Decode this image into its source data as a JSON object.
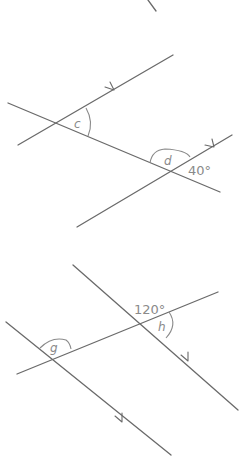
{
  "diagrams": [
    {
      "name": "diagram-1",
      "angles": [
        {
          "label": "c"
        },
        {
          "label": "d"
        },
        {
          "label": "40°"
        }
      ]
    },
    {
      "name": "diagram-2",
      "angles": [
        {
          "label": "120°"
        },
        {
          "label": "h"
        },
        {
          "label": "g"
        }
      ]
    }
  ],
  "colors": {
    "line": "#6a6a6a",
    "label": "#8a8a8a",
    "background": "#ffffff"
  }
}
